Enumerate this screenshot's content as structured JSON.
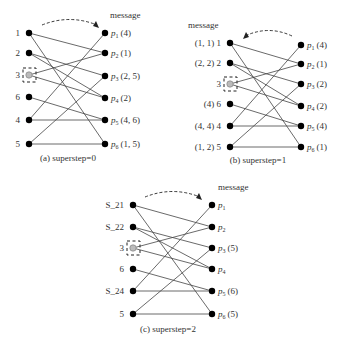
{
  "figure": {
    "highlighted_vertex": "3",
    "edges": [
      [
        "1",
        "p2"
      ],
      [
        "1",
        "p6"
      ],
      [
        "2",
        "p3"
      ],
      [
        "2",
        "p4"
      ],
      [
        "3",
        "p2"
      ],
      [
        "3",
        "p4"
      ],
      [
        "6",
        "p5"
      ],
      [
        "4",
        "p1"
      ],
      [
        "4",
        "p5"
      ],
      [
        "5",
        "p3"
      ],
      [
        "5",
        "p6"
      ]
    ],
    "panels": [
      {
        "id": "a",
        "caption": "(a)  superstep=0",
        "message_label": "message",
        "arrow_direction": "right",
        "left_nodes": [
          {
            "label": "1",
            "prefix": ""
          },
          {
            "label": "2",
            "prefix": ""
          },
          {
            "label": "3",
            "prefix": ""
          },
          {
            "label": "6",
            "prefix": ""
          },
          {
            "label": "4",
            "prefix": ""
          },
          {
            "label": "5",
            "prefix": ""
          }
        ],
        "right_nodes": [
          {
            "name": "p",
            "sub": "1",
            "msg": "(4)"
          },
          {
            "name": "p",
            "sub": "2",
            "msg": "(1)"
          },
          {
            "name": "p",
            "sub": "3",
            "msg": "(2, 5)"
          },
          {
            "name": "p",
            "sub": "4",
            "msg": "(2)"
          },
          {
            "name": "p",
            "sub": "5",
            "msg": "(4, 6)"
          },
          {
            "name": "p",
            "sub": "6",
            "msg": "(1, 5)"
          }
        ]
      },
      {
        "id": "b",
        "caption": "(b)  superstep=1",
        "message_label": "message",
        "arrow_direction": "left",
        "left_nodes": [
          {
            "label": "1",
            "prefix": "(1, 1)"
          },
          {
            "label": "2",
            "prefix": "(2, 2)"
          },
          {
            "label": "3",
            "prefix": ""
          },
          {
            "label": "6",
            "prefix": "(4)"
          },
          {
            "label": "4",
            "prefix": "(4, 4)"
          },
          {
            "label": "5",
            "prefix": "(1, 2)"
          }
        ],
        "right_nodes": [
          {
            "name": "p",
            "sub": "1",
            "msg": "(4)"
          },
          {
            "name": "p",
            "sub": "2",
            "msg": "(1)"
          },
          {
            "name": "p",
            "sub": "3",
            "msg": "(2)"
          },
          {
            "name": "p",
            "sub": "4",
            "msg": "(2)"
          },
          {
            "name": "p",
            "sub": "5",
            "msg": "(4)"
          },
          {
            "name": "p",
            "sub": "6",
            "msg": "(1)"
          }
        ]
      },
      {
        "id": "c",
        "caption": "(c)  superstep=2",
        "message_label": "message",
        "arrow_direction": "right",
        "left_nodes": [
          {
            "label": "1",
            "prefix": "S_2"
          },
          {
            "label": "2",
            "prefix": "S_2"
          },
          {
            "label": "3",
            "prefix": ""
          },
          {
            "label": "6",
            "prefix": ""
          },
          {
            "label": "4",
            "prefix": "S_2"
          },
          {
            "label": "5",
            "prefix": ""
          }
        ],
        "right_nodes": [
          {
            "name": "p",
            "sub": "1",
            "msg": ""
          },
          {
            "name": "p",
            "sub": "2",
            "msg": ""
          },
          {
            "name": "p",
            "sub": "3",
            "msg": "(5)"
          },
          {
            "name": "p",
            "sub": "4",
            "msg": ""
          },
          {
            "name": "p",
            "sub": "5",
            "msg": "(6)"
          },
          {
            "name": "p",
            "sub": "6",
            "msg": "(5)"
          }
        ]
      }
    ]
  }
}
